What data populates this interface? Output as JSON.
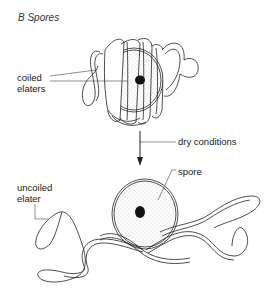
{
  "title": "B  Spores",
  "labels": {
    "coiled_elaters_1": "coiled",
    "coiled_elaters_2": "elaters",
    "dry_conditions": "dry conditions",
    "spore": "spore",
    "uncoiled_elater_1": "uncoiled",
    "uncoiled_elater_2": "elater"
  },
  "colors": {
    "line": "#222222",
    "stipple": "#9a9a9a",
    "nucleus": "#111111",
    "background": "#ffffff"
  }
}
